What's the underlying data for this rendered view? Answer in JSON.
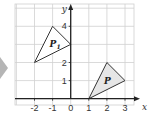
{
  "diagram": {
    "title": "",
    "x_axis": {
      "label": "x",
      "ticks": [
        -2,
        -1,
        0,
        1,
        2,
        3
      ],
      "tick_labels": [
        "-2",
        "-1",
        "0",
        "1",
        "2",
        "3"
      ],
      "range": [
        -3,
        4
      ]
    },
    "y_axis": {
      "label": "y",
      "ticks": [
        1,
        2,
        4
      ],
      "tick_labels": [
        "1",
        "2",
        "4"
      ],
      "range": [
        -0.1,
        4.6
      ]
    },
    "grid": true,
    "shapes": [
      {
        "name": "P",
        "subscript": "",
        "vertices": [
          [
            1,
            0
          ],
          [
            2,
            2
          ],
          [
            3,
            1
          ]
        ],
        "fill": "#e6e6e6",
        "stroke": "#333333",
        "label_at": [
          2,
          1
        ]
      },
      {
        "name": "P",
        "subscript": "1",
        "vertices": [
          [
            -2,
            2
          ],
          [
            -1,
            4
          ],
          [
            0,
            3
          ]
        ],
        "fill": "#ffffff",
        "stroke": "#333333",
        "label_at": [
          -1,
          3
        ]
      }
    ],
    "pointer_arrow": {
      "direction": "right",
      "color": "#b5b5b5"
    }
  },
  "colors": {
    "grid": "#d0d0d0",
    "axis": "#222222",
    "background": "#ffffff"
  }
}
